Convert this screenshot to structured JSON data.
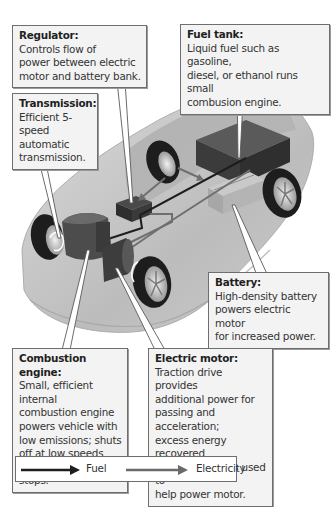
{
  "diagram": {
    "callouts": [
      {
        "id": "regulator",
        "title": "Regulator:",
        "lines": [
          "Controls flow of",
          "power between electric",
          "motor and battery bank."
        ]
      },
      {
        "id": "fuel_tank",
        "title": "Fuel tank:",
        "lines": [
          "Liquid fuel such as gasoline,",
          "diesel, or ethanol runs small",
          "combusion engine."
        ]
      },
      {
        "id": "transmission",
        "title": "Transmission:",
        "lines": [
          "Efficient 5-speed",
          "automatic",
          "transmission."
        ]
      },
      {
        "id": "battery",
        "title": "Battery:",
        "lines": [
          "High-density battery",
          "powers electric motor",
          "for increased power."
        ]
      },
      {
        "id": "combustion_engine",
        "title": "Combustion engine:",
        "lines": [
          "Small, efficient internal",
          "combustion engine",
          "powers vehicle with",
          "low emissions; shuts",
          "off at low speeds and",
          "stops."
        ]
      },
      {
        "id": "electric_motor",
        "title": "Electric motor:",
        "lines": [
          "Traction drive provides",
          "additional power for",
          "passing and acceleration;",
          "excess energy recovered",
          "during braking is used to",
          "help power motor."
        ]
      }
    ],
    "legend": [
      {
        "label": "Fuel",
        "color": "#1e1e1e",
        "icon": "dark-arrow-icon"
      },
      {
        "label": "Electricity",
        "color": "#6a6a6a",
        "icon": "gray-arrow-icon"
      }
    ],
    "colors": {
      "box_bg": "#f3f3f3",
      "box_border": "#6e6e6e",
      "fuel": "#1e1e1e",
      "electricity": "#6a6a6a"
    }
  }
}
